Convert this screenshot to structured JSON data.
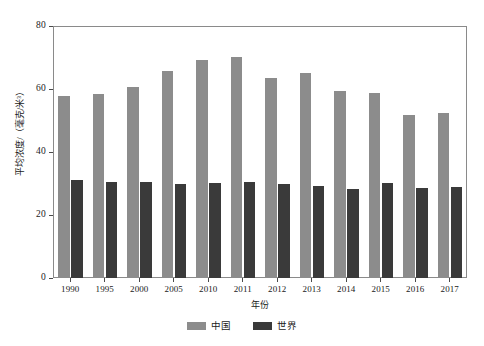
{
  "chart_data": {
    "type": "bar",
    "title": "",
    "xlabel": "年份",
    "ylabel": "平均浓度/（毫克/米³）",
    "categories": [
      "1990",
      "1995",
      "2000",
      "2005",
      "2010",
      "2011",
      "2012",
      "2013",
      "2014",
      "2015",
      "2016",
      "2017"
    ],
    "series": [
      {
        "name": "中国",
        "color": "#8c8c8c",
        "values": [
          57.8,
          58.4,
          60.6,
          65.7,
          69.2,
          70.3,
          63.4,
          65.2,
          59.5,
          58.8,
          51.8,
          52.4
        ]
      },
      {
        "name": "世界",
        "color": "#3a3a3a",
        "values": [
          31.0,
          30.5,
          30.4,
          30.0,
          30.2,
          30.6,
          29.8,
          29.3,
          28.2,
          30.2,
          28.7,
          29.0
        ]
      }
    ],
    "ylim": [
      0,
      80
    ],
    "yticks": [
      "0",
      "20",
      "40",
      "60",
      "80"
    ],
    "ytick_values": [
      0,
      20,
      40,
      60,
      80
    ],
    "grid": false,
    "legend_position": "bottom"
  },
  "legend": {
    "entries": [
      {
        "label": "中国",
        "color": "#8c8c8c"
      },
      {
        "label": "世界",
        "color": "#3a3a3a"
      }
    ]
  },
  "axes": {
    "y_title": "平均浓度/（毫克/米³）",
    "x_title": "年份"
  }
}
